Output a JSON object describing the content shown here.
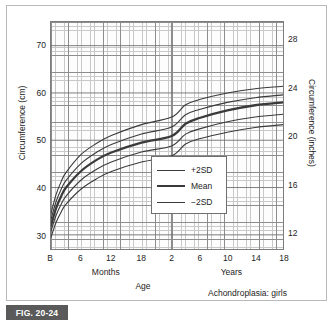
{
  "figure": {
    "number_label": "FIG. 20-24",
    "condition_label": "Achondroplasia: girls"
  },
  "chart_data": {
    "type": "line",
    "title": "",
    "subtitle": "Achondroplasia: girls",
    "xlabel": "Age",
    "ylabel": "Circumference (cm)",
    "ylabel_secondary": "Circumference (inches)",
    "grid": true,
    "legend_position": "inside-lower-right",
    "ylim": [
      27,
      75
    ],
    "yticks": [
      30,
      40,
      50,
      60,
      70
    ],
    "ytick_labels": [
      "30",
      "40",
      "50",
      "60",
      "70"
    ],
    "ylim_secondary": [
      10.6,
      29.5
    ],
    "yticks_secondary": [
      12,
      16,
      20,
      24,
      28
    ],
    "ytick_labels_secondary": [
      "12",
      "16",
      "20",
      "24",
      "28"
    ],
    "xtick_labels": [
      "B",
      "6",
      "12",
      "18",
      "2",
      "6",
      "10",
      "14",
      "18"
    ],
    "xtick_values_months": [
      0,
      6,
      12,
      18,
      24,
      72,
      120,
      168,
      216
    ],
    "x_group_labels": [
      {
        "label": "Months",
        "center_months": 11
      },
      {
        "label": "Years",
        "center_months": 126
      }
    ],
    "x_axis_break_at": "2 years",
    "series": [
      {
        "name": "+2SD",
        "style": "thin",
        "points": [
          {
            "x_months": 0,
            "cm": 34.5
          },
          {
            "x_months": 1,
            "cm": 38.5
          },
          {
            "x_months": 2,
            "cm": 41.2
          },
          {
            "x_months": 3,
            "cm": 43.2
          },
          {
            "x_months": 6,
            "cm": 47.0
          },
          {
            "x_months": 9,
            "cm": 49.3
          },
          {
            "x_months": 12,
            "cm": 51.0
          },
          {
            "x_months": 18,
            "cm": 53.3
          },
          {
            "x_months": 24,
            "cm": 54.9
          },
          {
            "x_months": 48,
            "cm": 57.5
          },
          {
            "x_months": 72,
            "cm": 58.6
          },
          {
            "x_months": 120,
            "cm": 60.0
          },
          {
            "x_months": 168,
            "cm": 60.9
          },
          {
            "x_months": 216,
            "cm": 61.4
          }
        ]
      },
      {
        "name": "+1SD",
        "style": "thin",
        "points": [
          {
            "x_months": 0,
            "cm": 33.3
          },
          {
            "x_months": 1,
            "cm": 37.0
          },
          {
            "x_months": 2,
            "cm": 39.6
          },
          {
            "x_months": 3,
            "cm": 41.5
          },
          {
            "x_months": 6,
            "cm": 45.1
          },
          {
            "x_months": 9,
            "cm": 47.4
          },
          {
            "x_months": 12,
            "cm": 49.1
          },
          {
            "x_months": 18,
            "cm": 51.3
          },
          {
            "x_months": 24,
            "cm": 52.8
          },
          {
            "x_months": 48,
            "cm": 55.4
          },
          {
            "x_months": 72,
            "cm": 56.5
          },
          {
            "x_months": 120,
            "cm": 58.0
          },
          {
            "x_months": 168,
            "cm": 59.0
          },
          {
            "x_months": 216,
            "cm": 59.6
          }
        ]
      },
      {
        "name": "Mean",
        "style": "thick",
        "points": [
          {
            "x_months": 0,
            "cm": 32.0
          },
          {
            "x_months": 1,
            "cm": 35.6
          },
          {
            "x_months": 2,
            "cm": 38.1
          },
          {
            "x_months": 3,
            "cm": 40.0
          },
          {
            "x_months": 6,
            "cm": 43.5
          },
          {
            "x_months": 9,
            "cm": 45.8
          },
          {
            "x_months": 12,
            "cm": 47.4
          },
          {
            "x_months": 18,
            "cm": 49.5
          },
          {
            "x_months": 24,
            "cm": 50.9
          },
          {
            "x_months": 48,
            "cm": 53.5
          },
          {
            "x_months": 72,
            "cm": 54.7
          },
          {
            "x_months": 120,
            "cm": 56.3
          },
          {
            "x_months": 168,
            "cm": 57.4
          },
          {
            "x_months": 216,
            "cm": 58.0
          }
        ]
      },
      {
        "name": "-1SD",
        "style": "thin",
        "points": [
          {
            "x_months": 0,
            "cm": 30.8
          },
          {
            "x_months": 1,
            "cm": 34.1
          },
          {
            "x_months": 2,
            "cm": 36.4
          },
          {
            "x_months": 3,
            "cm": 38.2
          },
          {
            "x_months": 6,
            "cm": 41.6
          },
          {
            "x_months": 9,
            "cm": 43.8
          },
          {
            "x_months": 12,
            "cm": 45.4
          },
          {
            "x_months": 18,
            "cm": 47.5
          },
          {
            "x_months": 24,
            "cm": 48.8
          },
          {
            "x_months": 48,
            "cm": 51.3
          },
          {
            "x_months": 72,
            "cm": 52.4
          },
          {
            "x_months": 120,
            "cm": 53.9
          },
          {
            "x_months": 168,
            "cm": 54.9
          },
          {
            "x_months": 216,
            "cm": 55.5
          }
        ]
      },
      {
        "name": "-2SD",
        "style": "thin",
        "points": [
          {
            "x_months": 0,
            "cm": 29.5
          },
          {
            "x_months": 1,
            "cm": 32.6
          },
          {
            "x_months": 2,
            "cm": 34.8
          },
          {
            "x_months": 3,
            "cm": 36.5
          },
          {
            "x_months": 6,
            "cm": 39.7
          },
          {
            "x_months": 9,
            "cm": 41.8
          },
          {
            "x_months": 12,
            "cm": 43.4
          },
          {
            "x_months": 18,
            "cm": 45.4
          },
          {
            "x_months": 24,
            "cm": 46.7
          },
          {
            "x_months": 48,
            "cm": 49.2
          },
          {
            "x_months": 72,
            "cm": 50.3
          },
          {
            "x_months": 120,
            "cm": 51.7
          },
          {
            "x_months": 168,
            "cm": 52.7
          },
          {
            "x_months": 216,
            "cm": 53.3
          }
        ]
      }
    ],
    "legend": [
      {
        "label": "+2SD",
        "style": "thin"
      },
      {
        "label": "Mean",
        "style": "thick"
      },
      {
        "label": "-2SD",
        "style": "thin"
      }
    ],
    "colors": {
      "curve": "#3a3a3a",
      "grid_minor": "#c9c9c9",
      "grid_major": "#8d8d8d",
      "frame": "#7d7d7d",
      "banner": "#5a5a5a",
      "text": "#232323"
    }
  }
}
